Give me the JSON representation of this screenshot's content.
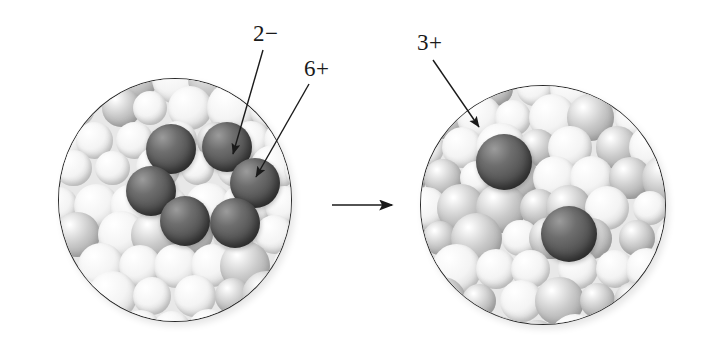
{
  "diagram": {
    "type": "reaction-schematic",
    "background_color": "#ffffff",
    "ion_color": "#5a5a5a",
    "solvent_color": "#e2e2e2",
    "outline_color": "#2a2a2a"
  },
  "labels": {
    "anion_charge": "2−",
    "cation_charge": "6+",
    "product_charge": "3+"
  },
  "panels": {
    "left": {
      "name": "reactant-beaker",
      "cluster_label": "ionic cluster",
      "ion_count": 6,
      "callouts": [
        {
          "text": "2−",
          "points_to": "anion-sphere"
        },
        {
          "text": "6+",
          "points_to": "cation-sphere"
        }
      ]
    },
    "right": {
      "name": "product-beaker",
      "ion_count": 2,
      "callouts": [
        {
          "text": "3+",
          "points_to": "hydrated-ion-upper"
        }
      ]
    }
  },
  "reaction_arrow": {
    "name": "reaction-arrow",
    "direction": "right",
    "glyph": "→"
  },
  "chart_data": {
    "type": "diagram",
    "panels": [
      {
        "label": "before",
        "dark_spheres": 6,
        "charges": [
          "2−",
          "6+"
        ]
      },
      {
        "label": "after",
        "dark_spheres": 2,
        "charges": [
          "3+"
        ]
      }
    ]
  }
}
